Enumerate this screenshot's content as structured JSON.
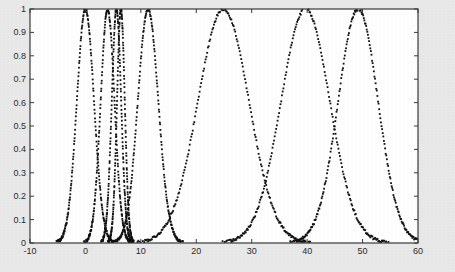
{
  "figure": {
    "background_color": "#e9e9e9",
    "plot_background_color": "#ffffff",
    "axis_color": "#3a3a3a",
    "marker_color": "#111111"
  },
  "chart_data": {
    "type": "scatter",
    "title": "",
    "xlabel": "",
    "ylabel": "",
    "xlim": [
      -10,
      60
    ],
    "ylim": [
      0,
      1
    ],
    "grid": false,
    "legend": null,
    "marker": "dot",
    "marker_color": "#111111",
    "marker_size_px": 1.8,
    "xticks": [
      -10,
      0,
      10,
      20,
      30,
      40,
      50,
      60
    ],
    "xtick_labels": [
      "-10",
      "0",
      "10",
      "20",
      "30",
      "40",
      "50",
      "60"
    ],
    "yticks": [
      0,
      0.1,
      0.2,
      0.3,
      0.4,
      0.5,
      0.6,
      0.7,
      0.8,
      0.9,
      1
    ],
    "ytick_labels": [
      "0",
      "0.1",
      "0.2",
      "0.3",
      "0.4",
      "0.5",
      "0.6",
      "0.7",
      "0.8",
      "0.9",
      "1"
    ],
    "series": [
      {
        "name": "peak-1",
        "center": 0.0,
        "width": 1.55,
        "peak": 1.0
      },
      {
        "name": "peak-2",
        "center": 4.0,
        "width": 1.25,
        "peak": 1.0
      },
      {
        "name": "peak-3",
        "center": 5.6,
        "width": 0.85,
        "peak": 1.0
      },
      {
        "name": "peak-4",
        "center": 6.4,
        "width": 0.7,
        "peak": 1.0
      },
      {
        "name": "peak-5",
        "center": 11.3,
        "width": 1.85,
        "peak": 1.0
      },
      {
        "name": "peak-6",
        "center": 24.9,
        "width": 4.6,
        "peak": 1.0
      },
      {
        "name": "peak-7",
        "center": 39.7,
        "width": 4.4,
        "peak": 1.0
      },
      {
        "name": "peak-8",
        "center": 49.2,
        "width": 3.6,
        "peak": 1.0
      }
    ],
    "n_points_per_series": 230,
    "scatter_jitter": 0.012
  }
}
